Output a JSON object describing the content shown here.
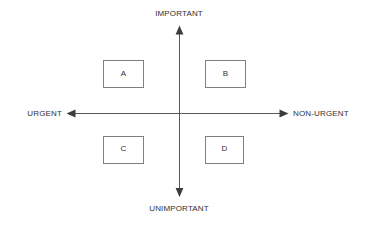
{
  "diagram": {
    "type": "priority-matrix",
    "title": "",
    "background_color": "#ffffff",
    "line_color": "#58585a",
    "box_border_color": "#808082",
    "text_color": "#2f2f31",
    "axes": {
      "vertical": {
        "top_label": "IMPORTANT",
        "bottom_label": "UNIMPORTANT",
        "top_arrow": "arrow-up",
        "bottom_arrow": "arrow-down"
      },
      "horizontal": {
        "left_label": "URGENT",
        "right_label": "NON-URGENT",
        "left_arrow": "arrow-left",
        "right_arrow": "arrow-right"
      },
      "origin": {
        "x": 179,
        "y": 113
      }
    },
    "quadrants": [
      {
        "id": "a",
        "label": "A",
        "position": "top-left",
        "meaning": "important-urgent",
        "x": 103,
        "y": 60,
        "width": 41,
        "height": 28
      },
      {
        "id": "b",
        "label": "B",
        "position": "top-right",
        "meaning": "important-non-urgent",
        "x": 205,
        "y": 60,
        "width": 41,
        "height": 28
      },
      {
        "id": "c",
        "label": "C",
        "position": "bottom-left",
        "meaning": "unimportant-urgent",
        "x": 103,
        "y": 136,
        "width": 41,
        "height": 28
      },
      {
        "id": "d",
        "label": "D",
        "position": "bottom-right",
        "meaning": "unimportant-non-urgent",
        "x": 205,
        "y": 136,
        "width": 39,
        "height": 28
      }
    ]
  }
}
